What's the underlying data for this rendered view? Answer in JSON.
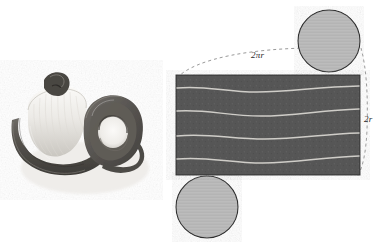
{
  "figure": {
    "caption": "",
    "background_color": "#ffffff",
    "width": 385,
    "height": 248
  },
  "photo_panel": {
    "name": "rolled-strip-photograph",
    "description": "Black and white photograph of a rolled paper strip forming a coil beside an unrolled loop",
    "tone_light": "#f2f0ee",
    "tone_mid": "#9a9792",
    "tone_dark": "#4a4845",
    "tone_darkest": "#303030"
  },
  "diagram_panel": {
    "name": "unrolled-cylinder-diagram",
    "rectangle": {
      "label": "lateral-surface-rectangle",
      "fill_color": "#565656",
      "stroke_color": "#2f2f2f",
      "x": 176,
      "y": 75,
      "width": 184,
      "height": 100
    },
    "wavy_lines": {
      "label": "fold-crease-lines",
      "count": 4,
      "color": "#cfcdc8",
      "y_positions": [
        88,
        110,
        135,
        158
      ]
    },
    "circles": [
      {
        "name": "top-circle-cap",
        "cx": 329,
        "cy": 41,
        "r": 31,
        "fill_color": "#b8b8b8",
        "stroke_color": "#2f2f2f"
      },
      {
        "name": "bottom-circle-cap",
        "cx": 207,
        "cy": 207,
        "r": 31,
        "fill_color": "#b8b8b8",
        "stroke_color": "#2f2f2f"
      }
    ],
    "dashed_guides": [
      {
        "name": "circumference-guide",
        "color": "#8d8d8d",
        "dash": "3 3"
      },
      {
        "name": "diameter-guide",
        "color": "#8d8d8d",
        "dash": "3 3"
      }
    ],
    "labels": {
      "circumference": "2πr",
      "diameter": "2r"
    }
  }
}
